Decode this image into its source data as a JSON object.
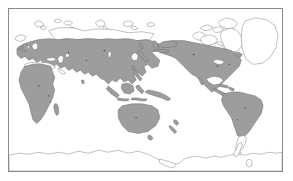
{
  "figure": {
    "type": "distribution-map",
    "projection": "pacific-centered-equirectangular",
    "frame": {
      "visible": true,
      "color": "#8a8a8a",
      "x": 8,
      "y": 8,
      "width": 275,
      "height": 164
    },
    "background_color": "#ffffff",
    "title": "",
    "caption": "",
    "legend": {
      "visible": false,
      "entries": []
    },
    "axes": {
      "visible": false,
      "tick_labels": []
    },
    "scale_bar": {
      "visible": false
    },
    "colors": {
      "range_fill": "#9d9d9d",
      "range_outline": "#6f6f6f",
      "land_outline": "#8d8d8d",
      "ocean": "#ffffff",
      "frame": "#8a8a8a"
    },
    "regions_shaded": [
      "Europe",
      "Africa",
      "Madagascar",
      "Middle East",
      "South Asia",
      "Central Asia",
      "Siberia (southern)",
      "East Asia",
      "Japan",
      "Southeast Asia",
      "Indonesia",
      "Philippines",
      "New Guinea",
      "Australia",
      "New Zealand",
      "Alaska",
      "Canada (southern)",
      "United States",
      "Mexico",
      "Central America",
      "Caribbean",
      "South America (north and central)"
    ],
    "regions_unshaded": [
      "Arctic Ocean islands",
      "Svalbard",
      "Novaya Zemlya",
      "Severnaya Zemlya",
      "New Siberian Islands",
      "Canadian Arctic Archipelago",
      "Greenland",
      "Iceland (partial)",
      "Patagonia (southern South America)",
      "Antarctica"
    ]
  },
  "map_data": {
    "type": "choropleth-presence",
    "value_categories": [
      {
        "name": "present",
        "color": "#9d9d9d"
      },
      {
        "name": "absent",
        "color": "#ffffff"
      }
    ]
  }
}
